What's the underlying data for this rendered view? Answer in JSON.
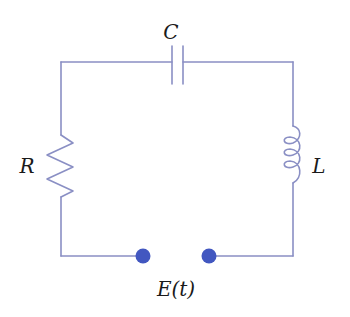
{
  "diagram": {
    "type": "RLC circuit",
    "colors": {
      "wire": "#8a8fc4",
      "terminal": "#4257c0",
      "label": "#1a1a1a"
    },
    "components": {
      "capacitor": {
        "label": "C"
      },
      "resistor": {
        "label": "R"
      },
      "inductor": {
        "label": "L"
      },
      "source": {
        "label": "E(t)"
      }
    }
  }
}
